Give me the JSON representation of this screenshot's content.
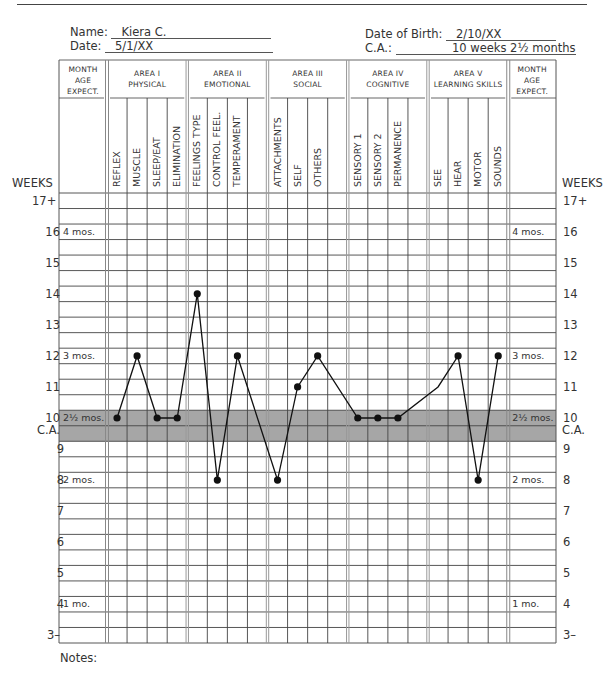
{
  "page": {
    "header_rule": true
  },
  "form": {
    "name_label": "Name:",
    "name_value": "Kiera C.",
    "date_label": "Date:",
    "date_value": "5/1/XX",
    "dob_label": "Date of Birth:",
    "dob_value": "2/10/XX",
    "ca_label": "C.A.:",
    "ca_value": "10 weeks 2½ months"
  },
  "table": {
    "month_header": [
      "MONTH",
      "AGE",
      "EXPECT."
    ],
    "areas": [
      {
        "title": "AREA I",
        "subtitle": "PHYSICAL",
        "columns": [
          "REFLEX",
          "MUSCLE",
          "SLEEP/EAT",
          "ELIMINATION"
        ]
      },
      {
        "title": "AREA II",
        "subtitle": "EMOTIONAL",
        "columns": [
          "FEELINGS TYPE",
          "CONTROL FEEL.",
          "TEMPERAMENT",
          ""
        ]
      },
      {
        "title": "AREA III",
        "subtitle": "SOCIAL",
        "columns": [
          "ATTACHMENTS",
          "SELF",
          "OTHERS",
          ""
        ]
      },
      {
        "title": "AREA IV",
        "subtitle": "COGNITIVE",
        "columns": [
          "SENSORY 1",
          "SENSORY 2",
          "PERMANENCE",
          ""
        ]
      },
      {
        "title": "AREA V",
        "subtitle": "LEARNING SKILLS",
        "columns": [
          "SEE",
          "HEAR",
          "MOTOR",
          "SOUNDS"
        ]
      }
    ],
    "weeks_label": "WEEKS",
    "week_ticks": [
      "17+",
      "16",
      "15",
      "14",
      "13",
      "12",
      "11",
      "10",
      "9",
      "8",
      "7",
      "6",
      "5",
      "4",
      "3–"
    ],
    "ca_tick": "C.A.",
    "month_marks": [
      {
        "week": 16,
        "label": "4 mos."
      },
      {
        "week": 12,
        "label": "3 mos."
      },
      {
        "week": 10,
        "label": "2½ mos."
      },
      {
        "week": 8,
        "label": "2 mos."
      },
      {
        "week": 4,
        "label": "1 mo."
      }
    ],
    "shaded_band": {
      "week": 10,
      "color": "#a6a6a6"
    },
    "notes_label": "Notes:"
  },
  "chart_data": {
    "type": "line",
    "xlabel": "Developmental areas",
    "ylabel": "WEEKS",
    "ylim": [
      3,
      17
    ],
    "grid": true,
    "categories": [
      "REFLEX",
      "MUSCLE",
      "SLEEP/EAT",
      "ELIMINATION",
      "FEELINGS TYPE",
      "CONTROL FEEL.",
      "TEMPERAMENT",
      "ATTACHMENTS",
      "SELF",
      "OTHERS",
      "SENSORY 1",
      "SENSORY 2",
      "PERMANENCE",
      "SEE",
      "HEAR",
      "MOTOR",
      "SOUNDS"
    ],
    "series": [
      {
        "name": "Kiera C.",
        "values": [
          10,
          12,
          10,
          10,
          14,
          8,
          12,
          8,
          11,
          12,
          10,
          10,
          10,
          11,
          12,
          8,
          12
        ],
        "markers": [
          true,
          true,
          true,
          true,
          true,
          true,
          true,
          true,
          true,
          true,
          true,
          true,
          true,
          false,
          true,
          true,
          true
        ]
      }
    ],
    "annotations": [
      "C.A. = 10 weeks (shaded band)"
    ]
  }
}
